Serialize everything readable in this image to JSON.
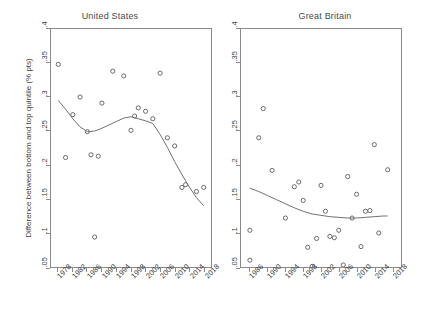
{
  "figure": {
    "y_axis_label": "Difference between bottom and top quintile (% pts)",
    "y_ticks": [
      ".4",
      ".35",
      ".3",
      ".25",
      ".2",
      ".15",
      ".1",
      ".05"
    ],
    "y_tick_values": [
      0.4,
      0.35,
      0.3,
      0.25,
      0.2,
      0.15,
      0.1,
      0.05
    ],
    "marker_style": "open-circle",
    "line_style": "smoothed-fit",
    "colors": {
      "axis": "#8a8a8a",
      "marker": "#5a5a5a",
      "fit_line": "#6e6e6e",
      "text": "#3f3f3f",
      "background": "#ffffff"
    }
  },
  "panels": [
    {
      "key": "united_states",
      "title": "United States",
      "x_ticks": [
        "1978",
        "1982",
        "1986",
        "1990",
        "1994",
        "1998",
        "2002",
        "2006",
        "2010",
        "2014",
        "2018"
      ],
      "x_tick_values": [
        1978,
        1982,
        1986,
        1990,
        1994,
        1998,
        2002,
        2006,
        2010,
        2014,
        2018
      ]
    },
    {
      "key": "great_britain",
      "title": "Great Britain",
      "x_ticks": [
        "1986",
        "1990",
        "1994",
        "1998",
        "2002",
        "2006",
        "2010",
        "2014",
        "2018"
      ],
      "x_tick_values": [
        1986,
        1990,
        1994,
        1998,
        2002,
        2006,
        2010,
        2014,
        2018
      ]
    }
  ],
  "chart_data": [
    {
      "type": "scatter",
      "panel": "United States",
      "title": "United States",
      "xlabel": "",
      "ylabel": "Difference between bottom and top quintile (% pts)",
      "xlim": [
        1976,
        2020
      ],
      "ylim": [
        0.05,
        0.4
      ],
      "grid": false,
      "legend": "none",
      "series": [
        {
          "name": "Observed difference",
          "type": "scatter",
          "marker": "open-circle",
          "x": [
            1978,
            1980,
            1982,
            1984,
            1986,
            1987,
            1988,
            1989,
            1990,
            1993,
            1996,
            1998,
            1999,
            2000,
            2002,
            2004,
            2006,
            2008,
            2010,
            2012,
            2013,
            2016,
            2018
          ],
          "y": [
            0.348,
            0.211,
            0.274,
            0.3,
            0.249,
            0.215,
            0.094,
            0.213,
            0.291,
            0.338,
            0.331,
            0.251,
            0.272,
            0.284,
            0.279,
            0.268,
            0.335,
            0.24,
            0.228,
            0.167,
            0.171,
            0.161,
            0.167
          ]
        },
        {
          "name": "Smoothed fit",
          "type": "line",
          "x": [
            1978,
            1980,
            1982,
            1984,
            1986,
            1988,
            1990,
            1992,
            1994,
            1996,
            1998,
            2000,
            2002,
            2004,
            2006,
            2008,
            2010,
            2012,
            2014,
            2016,
            2018
          ],
          "y": [
            0.295,
            0.282,
            0.268,
            0.256,
            0.249,
            0.25,
            0.254,
            0.259,
            0.264,
            0.269,
            0.271,
            0.268,
            0.265,
            0.261,
            0.245,
            0.226,
            0.205,
            0.186,
            0.168,
            0.152,
            0.14
          ]
        }
      ]
    },
    {
      "type": "scatter",
      "panel": "Great Britain",
      "title": "Great Britain",
      "xlabel": "",
      "ylabel": "",
      "xlim": [
        1984,
        2020
      ],
      "ylim": [
        0.05,
        0.4
      ],
      "grid": false,
      "legend": "none",
      "series": [
        {
          "name": "Observed difference",
          "type": "scatter",
          "marker": "open-circle",
          "x": [
            1986,
            1986,
            1988,
            1989,
            1991,
            1994,
            1996,
            1997,
            1998,
            1999,
            2000,
            2001,
            2002,
            2003,
            2004,
            2005,
            2006,
            2007,
            2008,
            2009,
            2010,
            2011,
            2012,
            2013,
            2014,
            2015,
            2017
          ],
          "y": [
            0.06,
            0.104,
            0.24,
            0.283,
            0.192,
            0.122,
            0.168,
            0.175,
            0.148,
            0.079,
            0.051,
            0.092,
            0.17,
            0.132,
            0.095,
            0.093,
            0.104,
            0.053,
            0.183,
            0.122,
            0.157,
            0.08,
            0.132,
            0.133,
            0.23,
            0.1,
            0.193
          ],
          "note": "1986 has two observations (0.060 and 0.104); 2018 point near 0.037"
        },
        {
          "name": "Smoothed fit",
          "type": "line",
          "x": [
            1986,
            1988,
            1990,
            1992,
            1994,
            1996,
            1998,
            2000,
            2002,
            2004,
            2006,
            2008,
            2010,
            2012,
            2014,
            2016,
            2017
          ],
          "y": [
            0.166,
            0.161,
            0.155,
            0.149,
            0.143,
            0.137,
            0.132,
            0.128,
            0.126,
            0.124,
            0.123,
            0.122,
            0.122,
            0.123,
            0.124,
            0.125,
            0.125
          ]
        }
      ]
    }
  ]
}
